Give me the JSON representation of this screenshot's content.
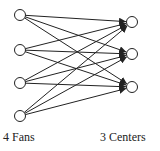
{
  "diagram": {
    "type": "bipartite-graph",
    "left_group": {
      "label": "4 Fans",
      "nodes": [
        {
          "id": "fan-1",
          "x": 20,
          "y": 15
        },
        {
          "id": "fan-2",
          "x": 20,
          "y": 50
        },
        {
          "id": "fan-3",
          "x": 20,
          "y": 83
        },
        {
          "id": "fan-4",
          "x": 20,
          "y": 116
        }
      ]
    },
    "right_group": {
      "label": "3 Centers",
      "nodes": [
        {
          "id": "center-1",
          "x": 132,
          "y": 22
        },
        {
          "id": "center-2",
          "x": 132,
          "y": 54
        },
        {
          "id": "center-3",
          "x": 132,
          "y": 87
        }
      ]
    },
    "edges": "all fans connect to all centers (directed, arrowheads at centers)",
    "node_radius": 5.5,
    "colors": {
      "stroke": "#222222",
      "node_fill": "#ffffff",
      "background": "#ffffff"
    }
  }
}
